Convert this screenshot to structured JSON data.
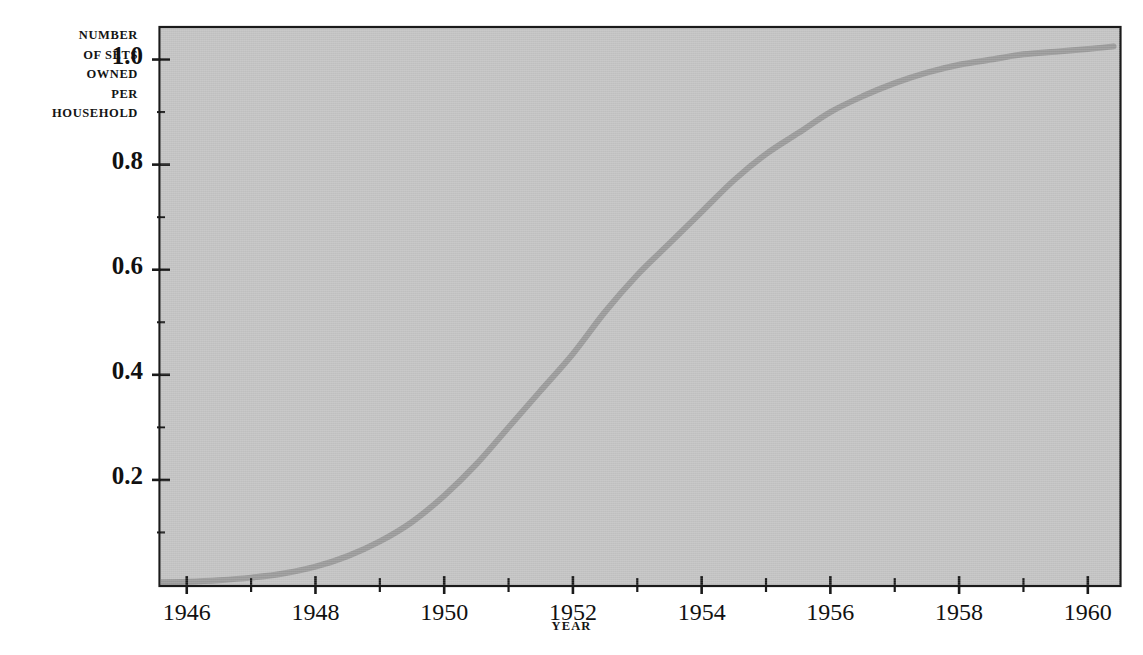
{
  "chart_data": {
    "type": "line",
    "title": "",
    "subtitle": "",
    "xlabel": "YEAR",
    "ylabel": "NUMBER OF SETS OWNED PER HOUSEHOLD",
    "ylabel_lines": [
      "NUMBER",
      "OF SETS",
      "OWNED",
      "PER",
      "HOUSEHOLD"
    ],
    "grid": false,
    "legend": false,
    "legend_position": "none",
    "xlim": [
      1945.6,
      1960.5
    ],
    "ylim": [
      0.0,
      1.06
    ],
    "x_major_ticks": [
      1946,
      1948,
      1950,
      1952,
      1954,
      1956,
      1958,
      1960
    ],
    "x_major_tick_labels": [
      "1946",
      "1948",
      "1950",
      "1952",
      "1954",
      "1956",
      "1958",
      "1960"
    ],
    "x_minor_ticks": [
      1947,
      1949,
      1951,
      1953,
      1955,
      1957,
      1959
    ],
    "y_major_ticks": [
      0.2,
      0.4,
      0.6,
      0.8,
      1.0
    ],
    "y_major_tick_labels": [
      "0.2",
      "0.4",
      "0.6",
      "0.8",
      "1.0"
    ],
    "y_minor_ticks": [
      0.1,
      0.3,
      0.5,
      0.7,
      0.9
    ],
    "series": [
      {
        "name": "Sets owned per household",
        "color": "#9a9a9a",
        "line_width": 6,
        "x": [
          1945.6,
          1946.0,
          1946.5,
          1947.0,
          1947.5,
          1948.0,
          1948.5,
          1949.0,
          1949.5,
          1950.0,
          1950.5,
          1951.0,
          1951.5,
          1952.0,
          1952.5,
          1953.0,
          1953.5,
          1954.0,
          1954.5,
          1955.0,
          1955.5,
          1956.0,
          1956.5,
          1957.0,
          1957.5,
          1958.0,
          1958.5,
          1959.0,
          1959.5,
          1960.0,
          1960.4
        ],
        "y": [
          0.005,
          0.006,
          0.009,
          0.014,
          0.022,
          0.035,
          0.055,
          0.083,
          0.12,
          0.17,
          0.23,
          0.3,
          0.37,
          0.44,
          0.52,
          0.59,
          0.65,
          0.71,
          0.77,
          0.82,
          0.86,
          0.9,
          0.93,
          0.955,
          0.975,
          0.99,
          1.0,
          1.01,
          1.015,
          1.02,
          1.025
        ]
      }
    ],
    "annotations": [],
    "background_color": "#c3c3c3",
    "axis_color": "#1a1a1a"
  },
  "colors": {
    "plot_background": "#c3c3c3",
    "curve": "#9a9a9a",
    "axis": "#1a1a1a",
    "text": "#111111",
    "page_background": "#ffffff"
  }
}
